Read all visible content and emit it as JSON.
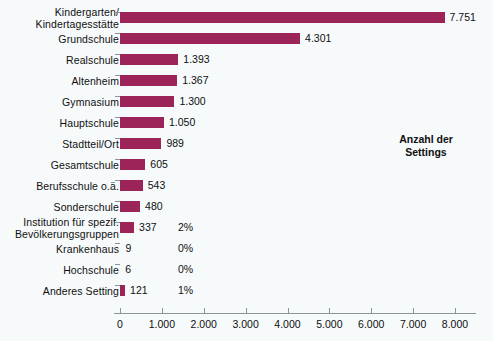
{
  "chart_data": {
    "type": "bar",
    "orientation": "horizontal",
    "title": "",
    "subtitle": "",
    "xlabel": "",
    "ylabel": "",
    "legend_position": "right-middle",
    "legend_title_lines": [
      "Anzahl der",
      "Settings"
    ],
    "grid": false,
    "xlim": [
      0,
      8400
    ],
    "xticks": [
      0,
      1000,
      2000,
      3000,
      4000,
      5000,
      6000,
      7000,
      8000
    ],
    "xtick_labels": [
      "0",
      "1.000",
      "2.000",
      "3.000",
      "4.000",
      "5.000",
      "6.000",
      "7.000",
      "8.000"
    ],
    "bar_color": "#9d2458",
    "axis_color": "#8d9499",
    "background_color": "#f7fafb",
    "categories": [
      "Kindergarten/\nKindertagesstätte",
      "Grundschule",
      "Realschule",
      "Altenheim",
      "Gymnasium",
      "Hauptschule",
      "Stadtteil/Ort",
      "Gesamtschule",
      "Berufsschule o.ä.",
      "Sonderschule",
      "Institution für spezif.\nBevölkerungsgruppen",
      "Krankenhaus",
      "Hochschule",
      "Anderes Setting"
    ],
    "values": [
      7751,
      4301,
      1393,
      1367,
      1300,
      1050,
      989,
      605,
      543,
      480,
      337,
      9,
      6,
      121
    ],
    "value_labels": [
      "7.751",
      "4.301",
      "1.393",
      "1.367",
      "1.300",
      "1.050",
      "989",
      "605",
      "543",
      "480",
      "337",
      "9",
      "6",
      "121"
    ],
    "percent_labels": [
      "",
      "",
      "",
      "",
      "",
      "",
      "",
      "",
      "",
      "",
      "2%",
      "0%",
      "0%",
      "1%"
    ]
  },
  "legend": {
    "line1": "Anzahl der",
    "line2": "Settings"
  },
  "rows": [
    {
      "label": "Kindergarten/\nKindertagesstätte",
      "value_label": "7.751",
      "percent": ""
    },
    {
      "label": "Grundschule",
      "value_label": "4.301",
      "percent": ""
    },
    {
      "label": "Realschule",
      "value_label": "1.393",
      "percent": ""
    },
    {
      "label": "Altenheim",
      "value_label": "1.367",
      "percent": ""
    },
    {
      "label": "Gymnasium",
      "value_label": "1.300",
      "percent": ""
    },
    {
      "label": "Hauptschule",
      "value_label": "1.050",
      "percent": ""
    },
    {
      "label": "Stadtteil/Ort",
      "value_label": "989",
      "percent": ""
    },
    {
      "label": "Gesamtschule",
      "value_label": "605",
      "percent": ""
    },
    {
      "label": "Berufsschule o.ä.",
      "value_label": "543",
      "percent": ""
    },
    {
      "label": "Sonderschule",
      "value_label": "480",
      "percent": ""
    },
    {
      "label": "Institution für spezif.\nBevölkerungsgruppen",
      "value_label": "337",
      "percent": "2%"
    },
    {
      "label": "Krankenhaus",
      "value_label": "9",
      "percent": "0%"
    },
    {
      "label": "Hochschule",
      "value_label": "6",
      "percent": "0%"
    },
    {
      "label": "Anderes Setting",
      "value_label": "121",
      "percent": "1%"
    }
  ],
  "xaxis": {
    "labels": [
      "0",
      "1.000",
      "2.000",
      "3.000",
      "4.000",
      "5.000",
      "6.000",
      "7.000",
      "8.000"
    ]
  }
}
